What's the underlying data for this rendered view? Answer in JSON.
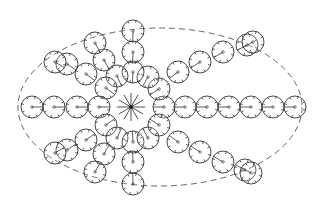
{
  "diagram": {
    "title": "",
    "colors": {
      "stroke": "#333333",
      "background": "#ffffff",
      "boundary": "#555555"
    },
    "boundary": {
      "shape": "ellipse",
      "cx": 160,
      "cy": 107,
      "rx": 142,
      "ry": 79,
      "style": "dashed"
    },
    "center": {
      "x": 131,
      "y": 107,
      "rays": 12,
      "ray_length": 14
    },
    "unit_radius": 11,
    "groups": [
      {
        "name": "inner-ring",
        "units": [
          [
            164,
            107
          ],
          [
            159,
            89
          ],
          [
            148,
            77
          ],
          [
            133,
            72
          ],
          [
            117,
            76
          ],
          [
            106,
            88
          ],
          [
            99,
            107
          ],
          [
            106,
            125
          ],
          [
            117,
            138
          ],
          [
            133,
            142
          ],
          [
            148,
            138
          ],
          [
            159,
            125
          ]
        ]
      },
      {
        "name": "arm-right",
        "units": [
          [
            185,
            107
          ],
          [
            207,
            107
          ],
          [
            229,
            107
          ],
          [
            251,
            107
          ],
          [
            273,
            107
          ],
          [
            295,
            107
          ]
        ]
      },
      {
        "name": "arm-left",
        "units": [
          [
            77,
            107
          ],
          [
            54,
            107
          ],
          [
            32,
            107
          ]
        ]
      },
      {
        "name": "arm-up",
        "units": [
          [
            133,
            52
          ],
          [
            133,
            31
          ]
        ]
      },
      {
        "name": "arm-down",
        "units": [
          [
            133,
            162
          ],
          [
            133,
            184
          ]
        ]
      },
      {
        "name": "arm-up-right",
        "units": [
          [
            178,
            72
          ],
          [
            200,
            62
          ],
          [
            223,
            52
          ],
          [
            247,
            45
          ],
          [
            253,
            42
          ]
        ]
      },
      {
        "name": "arm-down-right",
        "units": [
          [
            178,
            142
          ],
          [
            200,
            152
          ],
          [
            223,
            162
          ],
          [
            245,
            170
          ],
          [
            251,
            173
          ]
        ]
      },
      {
        "name": "arm-up-left",
        "units": [
          [
            86,
            74
          ],
          [
            67,
            64
          ],
          [
            55,
            62
          ],
          [
            104,
            60
          ],
          [
            95,
            43
          ]
        ]
      },
      {
        "name": "arm-down-left",
        "units": [
          [
            86,
            140
          ],
          [
            67,
            150
          ],
          [
            55,
            153
          ],
          [
            104,
            154
          ],
          [
            95,
            172
          ]
        ]
      }
    ]
  }
}
